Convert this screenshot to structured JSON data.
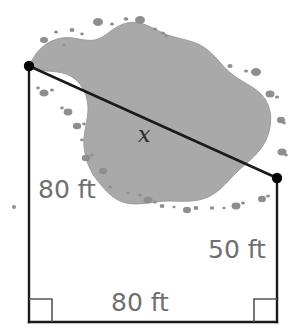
{
  "figure": {
    "title_visible": false,
    "shape_type": "quadrilateral-with-diagonal",
    "background_color": "#ffffff",
    "labels": {
      "left_side": "80 ft",
      "right_side": "50 ft",
      "bottom_side": "80 ft",
      "diagonal": "x"
    },
    "label_color": "#6f6f6f",
    "diagonal_label_color": "#2b2b2b",
    "line_color": "#1a1a1a",
    "marker_color": "#000000",
    "right_angle_marker_color": "#555555",
    "lake": {
      "name": "lake-region",
      "fill_color": "#a9a9a9",
      "outline_color": "#9a9a9a",
      "speck_color": "#8c8c8c"
    },
    "vertices": {
      "top_left": [
        29,
        66
      ],
      "right": [
        277,
        178
      ],
      "bottom_right": [
        277,
        322
      ],
      "bottom_left": [
        29,
        322
      ]
    },
    "right_angles": [
      "bottom-left",
      "bottom-right"
    ]
  }
}
